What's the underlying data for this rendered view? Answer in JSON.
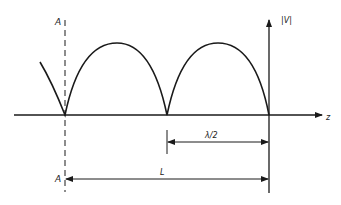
{
  "diagram": {
    "type": "standing-wave-magnitude",
    "labels": {
      "y_axis": "|V|",
      "x_axis": "z",
      "plane_top": "A",
      "plane_bottom": "A",
      "half_wavelength": "λ/2",
      "length": "L"
    },
    "colors": {
      "stroke": "#1a1a1a",
      "background": "#ffffff"
    }
  }
}
